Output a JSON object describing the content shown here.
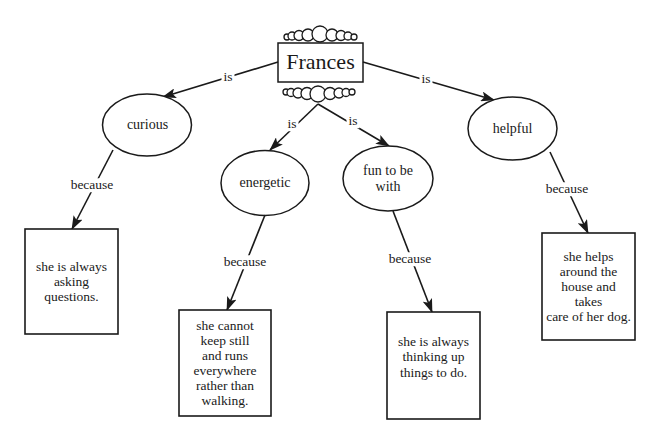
{
  "diagram": {
    "type": "concept-map",
    "root": {
      "label": "Frances"
    },
    "edge_labels": {
      "is": "is",
      "because": "because"
    },
    "branches": [
      {
        "relation": "is",
        "trait": "curious",
        "reason_relation": "because",
        "reason": [
          "she is always",
          "asking",
          "questions."
        ]
      },
      {
        "relation": "is",
        "trait": "energetic",
        "reason_relation": "because",
        "reason": [
          "she cannot",
          "keep still",
          "and runs",
          "everywhere",
          "rather than",
          "walking."
        ]
      },
      {
        "relation": "is",
        "trait": [
          "fun to be",
          "with"
        ],
        "reason_relation": "because",
        "reason": [
          "she is always",
          "thinking up",
          "things to do."
        ]
      },
      {
        "relation": "is",
        "trait": "helpful",
        "reason_relation": "because",
        "reason": [
          "she helps",
          "around the",
          "house and takes",
          "care of her dog."
        ]
      }
    ]
  },
  "colors": {
    "stroke": "#1a1a1a",
    "background": "#ffffff"
  }
}
